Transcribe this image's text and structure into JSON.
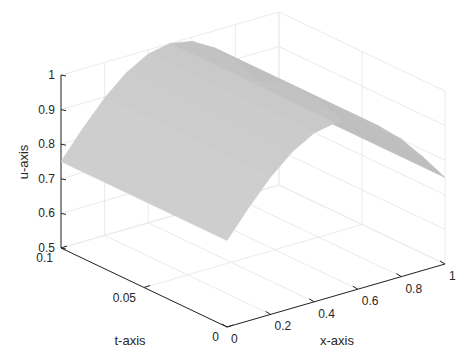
{
  "chart_data": {
    "type": "surface3d",
    "title": "",
    "xlabel": "x-axis",
    "ylabel": "t-axis",
    "zlabel": "u-axis",
    "xlim": [
      0,
      1
    ],
    "ylim": [
      0,
      0.1
    ],
    "zlim": [
      0.5,
      1
    ],
    "x_ticks": [
      "0",
      "0.2",
      "0.4",
      "0.6",
      "0.8",
      "1"
    ],
    "t_ticks": [
      "0",
      "0.05",
      "0.1"
    ],
    "u_ticks": [
      "0.5",
      "0.6",
      "0.7",
      "0.8",
      "0.9",
      "1"
    ],
    "grid": true,
    "colormap": "gray",
    "surface_description": "u(x,t) ≈ 0.75 + 0.25·sin(πx); u=0.75 at x=0 and x=1, peak ≈1.0 at x=0.5; nearly constant in t",
    "x": [
      0,
      0.1,
      0.2,
      0.3,
      0.4,
      0.5,
      0.6,
      0.7,
      0.8,
      0.9,
      1.0
    ],
    "t": [
      0,
      0.05,
      0.1
    ],
    "u": [
      [
        0.75,
        0.827,
        0.897,
        0.952,
        0.988,
        1.0,
        0.988,
        0.952,
        0.897,
        0.827,
        0.75
      ],
      [
        0.75,
        0.827,
        0.897,
        0.952,
        0.988,
        1.0,
        0.988,
        0.952,
        0.897,
        0.827,
        0.75
      ],
      [
        0.75,
        0.827,
        0.897,
        0.952,
        0.988,
        1.0,
        0.988,
        0.952,
        0.897,
        0.827,
        0.75
      ]
    ]
  }
}
